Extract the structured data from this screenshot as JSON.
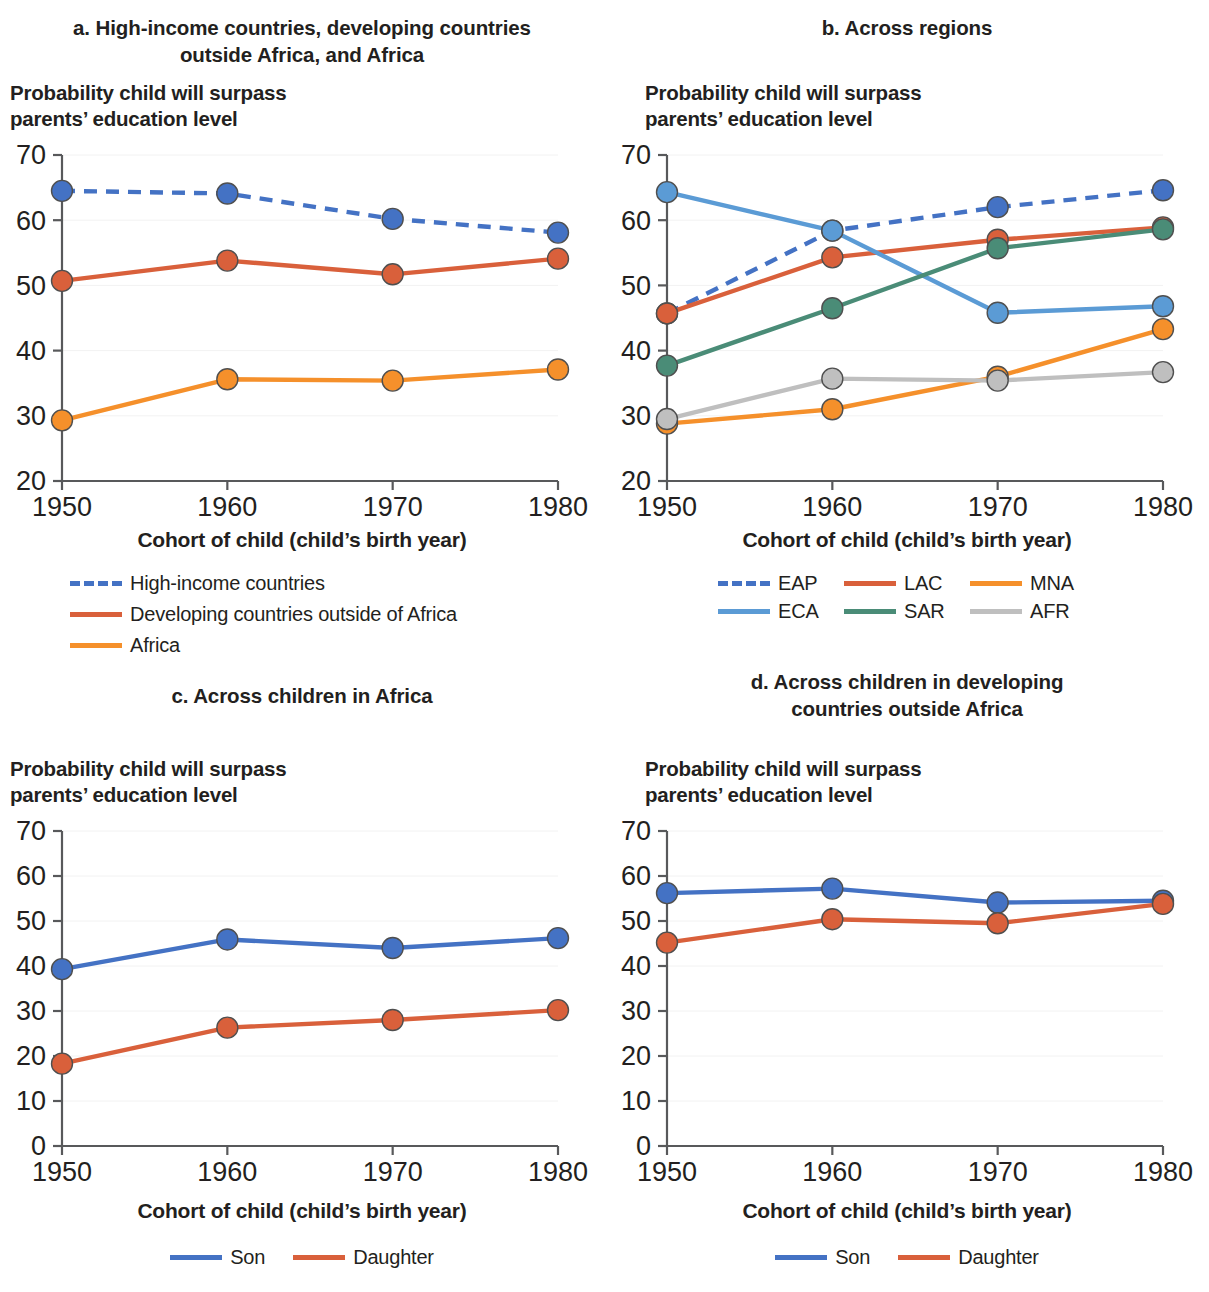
{
  "figure": {
    "background": "#ffffff",
    "xaxis_label": "Cohort of child (child’s birth year)",
    "yaxis_caption_line1": "Probability child will surpass",
    "yaxis_caption_line2": "parents’ education level"
  },
  "colors": {
    "high_income_blue": "#4472C4",
    "developing_red": "#D9603B",
    "africa_orange": "#F5902B",
    "eca_lightblue": "#5B9BD5",
    "sar_green": "#4A8C77",
    "afr_gray": "#BFBFBF",
    "son_blue": "#4472C4",
    "daughter_red": "#D9603B",
    "axis": "#58595B",
    "text": "#231f20"
  },
  "panels": {
    "a": {
      "title": "a. High-income countries, developing countries outside Africa, and Africa",
      "title_line1": "a. High-income countries, developing countries",
      "title_line2": "outside Africa, and Africa",
      "legend": [
        {
          "label": "High-income countries",
          "color": "#4472C4",
          "style": "dashed"
        },
        {
          "label": "Developing countries outside of Africa",
          "color": "#D9603B",
          "style": "solid"
        },
        {
          "label": "Africa",
          "color": "#F5902B",
          "style": "solid"
        }
      ]
    },
    "b": {
      "title": "b. Across regions",
      "title_line1": "b. Across regions",
      "title_line2": "",
      "legend_row1": [
        {
          "label": "EAP",
          "color": "#4472C4",
          "style": "dashed"
        },
        {
          "label": "LAC",
          "color": "#D9603B",
          "style": "solid"
        },
        {
          "label": "MNA",
          "color": "#F5902B",
          "style": "solid"
        }
      ],
      "legend_row2": [
        {
          "label": "ECA",
          "color": "#5B9BD5",
          "style": "solid"
        },
        {
          "label": "SAR",
          "color": "#4A8C77",
          "style": "solid"
        },
        {
          "label": "AFR",
          "color": "#BFBFBF",
          "style": "solid"
        }
      ]
    },
    "c": {
      "title": "c. Across children in Africa",
      "title_line1": "c. Across children in Africa",
      "title_line2": "",
      "legend": [
        {
          "label": "Son",
          "color": "#4472C4",
          "style": "solid"
        },
        {
          "label": "Daughter",
          "color": "#D9603B",
          "style": "solid"
        }
      ]
    },
    "d": {
      "title": "d. Across children in developing countries outside Africa",
      "title_line1": "d. Across children in developing",
      "title_line2": "countries outside Africa",
      "legend": [
        {
          "label": "Son",
          "color": "#4472C4",
          "style": "solid"
        },
        {
          "label": "Daughter",
          "color": "#D9603B",
          "style": "solid"
        }
      ]
    }
  },
  "chart_data": [
    {
      "id": "a",
      "type": "line",
      "title": "a. High-income countries, developing countries outside Africa, and Africa",
      "xlabel": "Cohort of child (child’s birth year)",
      "ylabel": "Probability child will surpass parents’ education level",
      "x": [
        1950,
        1960,
        1970,
        1980
      ],
      "xtick_labels": [
        "1950",
        "1960",
        "1970",
        "1980"
      ],
      "ylim": [
        20,
        70
      ],
      "yticks": [
        20,
        30,
        40,
        50,
        60,
        70
      ],
      "ytick_labels": [
        "20",
        "30",
        "40",
        "50",
        "60",
        "70"
      ],
      "grid": false,
      "legend_position": "below-left",
      "series": [
        {
          "name": "High-income countries",
          "color": "#4472C4",
          "style": "dashed",
          "marker": "circle",
          "values": [
            64.5,
            64.1,
            60.2,
            58.1
          ]
        },
        {
          "name": "Developing countries outside of Africa",
          "color": "#D9603B",
          "style": "solid",
          "marker": "circle",
          "values": [
            50.7,
            53.8,
            51.7,
            54.1
          ]
        },
        {
          "name": "Africa",
          "color": "#F5902B",
          "style": "solid",
          "marker": "circle",
          "values": [
            29.3,
            35.6,
            35.4,
            37.1
          ]
        }
      ]
    },
    {
      "id": "b",
      "type": "line",
      "title": "b. Across regions",
      "xlabel": "Cohort of child (child’s birth year)",
      "ylabel": "Probability child will surpass parents’ education level",
      "x": [
        1950,
        1960,
        1970,
        1980
      ],
      "xtick_labels": [
        "1950",
        "1960",
        "1970",
        "1980"
      ],
      "ylim": [
        20,
        70
      ],
      "yticks": [
        20,
        30,
        40,
        50,
        60,
        70
      ],
      "ytick_labels": [
        "20",
        "30",
        "40",
        "50",
        "60",
        "70"
      ],
      "grid": false,
      "legend_position": "below-center",
      "series": [
        {
          "name": "EAP",
          "color": "#4472C4",
          "style": "dashed",
          "marker": "circle",
          "values": [
            45.7,
            58.4,
            62.0,
            64.6
          ]
        },
        {
          "name": "LAC",
          "color": "#D9603B",
          "style": "solid",
          "marker": "circle",
          "values": [
            45.7,
            54.3,
            57.0,
            58.9
          ]
        },
        {
          "name": "MNA",
          "color": "#F5902B",
          "style": "solid",
          "marker": "circle",
          "values": [
            28.8,
            31.0,
            36.0,
            43.3
          ]
        },
        {
          "name": "ECA",
          "color": "#5B9BD5",
          "style": "solid",
          "marker": "circle",
          "values": [
            64.3,
            58.4,
            45.8,
            46.8
          ]
        },
        {
          "name": "SAR",
          "color": "#4A8C77",
          "style": "solid",
          "marker": "circle",
          "values": [
            37.7,
            46.5,
            55.7,
            58.6
          ]
        },
        {
          "name": "AFR",
          "color": "#BFBFBF",
          "style": "solid",
          "marker": "circle",
          "values": [
            29.5,
            35.7,
            35.4,
            36.7
          ]
        }
      ]
    },
    {
      "id": "c",
      "type": "line",
      "title": "c. Across children in Africa",
      "xlabel": "Cohort of child (child’s birth year)",
      "ylabel": "Probability child will surpass parents’ education level",
      "x": [
        1950,
        1960,
        1970,
        1980
      ],
      "xtick_labels": [
        "1950",
        "1960",
        "1970",
        "1980"
      ],
      "ylim": [
        0,
        70
      ],
      "yticks": [
        0,
        10,
        20,
        30,
        40,
        50,
        60,
        70
      ],
      "ytick_labels": [
        "0",
        "10",
        "20",
        "30",
        "40",
        "50",
        "60",
        "70"
      ],
      "grid": false,
      "legend_position": "below-center",
      "series": [
        {
          "name": "Son",
          "color": "#4472C4",
          "style": "solid",
          "marker": "circle",
          "values": [
            39.3,
            45.9,
            44.0,
            46.2
          ]
        },
        {
          "name": "Daughter",
          "color": "#D9603B",
          "style": "solid",
          "marker": "circle",
          "values": [
            18.3,
            26.3,
            28.0,
            30.2
          ]
        }
      ]
    },
    {
      "id": "d",
      "type": "line",
      "title": "d. Across children in developing countries outside Africa",
      "xlabel": "Cohort of child (child’s birth year)",
      "ylabel": "Probability child will surpass parents’ education level",
      "x": [
        1950,
        1960,
        1970,
        1980
      ],
      "xtick_labels": [
        "1950",
        "1960",
        "1970",
        "1980"
      ],
      "ylim": [
        0,
        70
      ],
      "yticks": [
        0,
        10,
        20,
        30,
        40,
        50,
        60,
        70
      ],
      "ytick_labels": [
        "0",
        "10",
        "20",
        "30",
        "40",
        "50",
        "60",
        "70"
      ],
      "grid": false,
      "legend_position": "below-center",
      "series": [
        {
          "name": "Son",
          "color": "#4472C4",
          "style": "solid",
          "marker": "circle",
          "values": [
            56.2,
            57.2,
            54.1,
            54.5
          ]
        },
        {
          "name": "Daughter",
          "color": "#D9603B",
          "style": "solid",
          "marker": "circle",
          "values": [
            45.2,
            50.4,
            49.5,
            53.8
          ]
        }
      ]
    }
  ]
}
